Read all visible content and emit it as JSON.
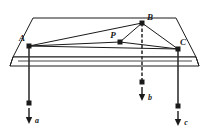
{
  "figure": {
    "colors": {
      "background": "#ffffff",
      "stroke": "#1a1a1a",
      "plate_face": "#ffffff",
      "plate_edge": "#1a1a1a",
      "label": "#1a1a1a"
    },
    "plate": {
      "name": "rigid-plate",
      "top_face": [
        [
          33,
          18
        ],
        [
          176,
          18
        ],
        [
          196,
          57
        ],
        [
          13,
          57
        ]
      ],
      "front_band_top_y": 57,
      "front_band_bottom_y": 66,
      "left_skew_bottom_x": 10,
      "right_skew_bottom_x": 199
    },
    "points": [
      {
        "id": "A",
        "label": "A",
        "x": 29,
        "y": 46,
        "label_x": 23,
        "label_y": 40
      },
      {
        "id": "B",
        "label": "B",
        "x": 142,
        "y": 23,
        "label_x": 148,
        "label_y": 20
      },
      {
        "id": "C",
        "label": "C",
        "x": 178,
        "y": 49,
        "label_x": 181,
        "label_y": 44
      },
      {
        "id": "P",
        "label": "P",
        "x": 120,
        "y": 42,
        "label_x": 113,
        "label_y": 37
      }
    ],
    "segments": [
      {
        "name": "segment-A-B",
        "from": "A",
        "to": "B"
      },
      {
        "name": "segment-A-P",
        "from": "A",
        "to": "P"
      },
      {
        "name": "segment-A-C",
        "from": "A",
        "to": "C"
      },
      {
        "name": "segment-B-P",
        "from": "B",
        "to": "P"
      },
      {
        "name": "segment-B-C",
        "from": "B",
        "to": "C"
      },
      {
        "name": "segment-P-C",
        "from": "P",
        "to": "C"
      }
    ],
    "vectors": [
      {
        "id": "a",
        "label": "a",
        "name": "force-vector-a",
        "anchor_point": "A",
        "stem_x": 29,
        "stem_top_y": 46,
        "stem_bottom_y": 103,
        "arrow_x": 29,
        "arrow_top_y": 108,
        "arrow_tip_y": 122,
        "label_x": 35,
        "label_y": 120,
        "direction": "down"
      },
      {
        "id": "b",
        "label": "b",
        "name": "force-vector-b",
        "anchor_point": "B",
        "stem_x": 142,
        "stem_top_y": 23,
        "stem_bottom_y": 82,
        "arrow_x": 142,
        "arrow_top_y": 86,
        "arrow_tip_y": 99,
        "label_x": 148,
        "label_y": 97,
        "direction": "down"
      },
      {
        "id": "c",
        "label": "c",
        "name": "force-vector-c",
        "anchor_point": "C",
        "stem_x": 178,
        "stem_top_y": 49,
        "stem_bottom_y": 106,
        "arrow_x": 178,
        "arrow_top_y": 110,
        "arrow_tip_y": 124,
        "label_x": 184,
        "label_y": 122,
        "direction": "down"
      }
    ]
  }
}
